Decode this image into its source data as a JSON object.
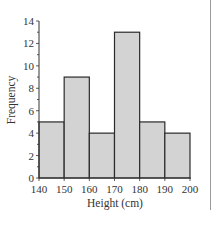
{
  "chart_data": {
    "type": "bar",
    "subtype": "histogram",
    "title": "",
    "xlabel": "Height (cm)",
    "ylabel": "Frequency",
    "bins": [
      {
        "from": 140,
        "to": 150,
        "value": 5
      },
      {
        "from": 150,
        "to": 160,
        "value": 9
      },
      {
        "from": 160,
        "to": 170,
        "value": 4
      },
      {
        "from": 170,
        "to": 180,
        "value": 13
      },
      {
        "from": 180,
        "to": 190,
        "value": 5
      },
      {
        "from": 190,
        "to": 200,
        "value": 4
      }
    ],
    "categories": [
      "140-150",
      "150-160",
      "160-170",
      "170-180",
      "180-190",
      "190-200"
    ],
    "values": [
      5,
      9,
      4,
      13,
      5,
      4
    ],
    "xticks": [
      "140",
      "150",
      "160",
      "170",
      "180",
      "190",
      "200"
    ],
    "yticks": [
      "0",
      "2",
      "4",
      "6",
      "8",
      "10",
      "12",
      "14"
    ],
    "xlim": [
      140,
      200
    ],
    "ylim": [
      0,
      14
    ],
    "grid": false,
    "legend": null,
    "colors": {
      "bar_fill": "#d3d3d3",
      "bar_stroke": "#2a2a2a",
      "axis": "#333333",
      "text": "#333333"
    }
  }
}
